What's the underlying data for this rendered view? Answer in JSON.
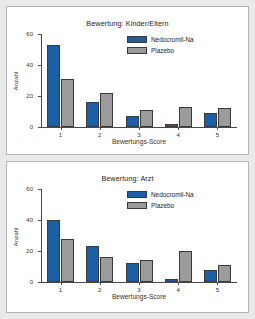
{
  "figure": {
    "background_color": "#e9e9e9",
    "panel_color": "#ffffff",
    "border_color": "#b6b6b6"
  },
  "colors": {
    "series_nedocromil": "#1d5fa4",
    "series_plazebo": "#9b9b9b",
    "axis": "#4a4a4a",
    "text": "#222222"
  },
  "chart_data": [
    {
      "type": "bar",
      "title": "Bewertung: Kinder/Eltern",
      "xlabel": "Bewertungs-Score",
      "ylabel": "Anzahl",
      "categories": [
        "1",
        "2",
        "3",
        "4",
        "5"
      ],
      "series": [
        {
          "name": "Nedocromil-Na",
          "color": "#1d5fa4",
          "values": [
            53,
            16,
            7,
            2,
            9
          ]
        },
        {
          "name": "Plazebo",
          "color": "#9b9b9b",
          "values": [
            31,
            22,
            11,
            13,
            12
          ]
        }
      ],
      "ylim": [
        0,
        60
      ],
      "yticks": [
        0,
        20,
        40,
        60
      ],
      "ytick_labels": [
        "0",
        "20",
        "40",
        "60"
      ],
      "grid": false,
      "legend_position": "top-right"
    },
    {
      "type": "bar",
      "title": "Bewertung: Arzt",
      "xlabel": "Bewertungs-Score",
      "ylabel": "Anzahl",
      "categories": [
        "1",
        "2",
        "3",
        "4",
        "5"
      ],
      "series": [
        {
          "name": "Nedocromil-Na",
          "color": "#1d5fa4",
          "values": [
            40,
            23,
            12,
            2,
            8
          ]
        },
        {
          "name": "Plazebo",
          "color": "#9b9b9b",
          "values": [
            28,
            16,
            14,
            20,
            11
          ]
        }
      ],
      "ylim": [
        0,
        60
      ],
      "yticks": [
        0,
        20,
        40,
        60
      ],
      "ytick_labels": [
        "0",
        "20",
        "40",
        "60"
      ],
      "grid": false,
      "legend_position": "top-right"
    }
  ]
}
